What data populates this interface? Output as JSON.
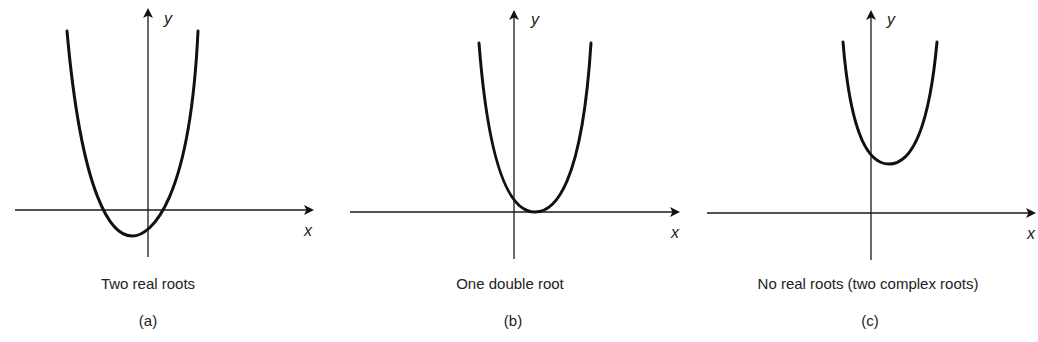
{
  "figure": {
    "panels": [
      {
        "id": "a",
        "caption": "Two real roots",
        "letter": "(a)",
        "x_label": "x",
        "y_label": "y",
        "case": "discriminant > 0",
        "curve": "upward parabola, vertex below x-axis, left of y-axis, crossing x-axis twice"
      },
      {
        "id": "b",
        "caption": "One double root",
        "letter": "(b)",
        "x_label": "x",
        "y_label": "y",
        "case": "discriminant = 0",
        "curve": "upward parabola, vertex touching x-axis, right of y-axis"
      },
      {
        "id": "c",
        "caption": "No real roots (two complex roots)",
        "letter": "(c)",
        "x_label": "x",
        "y_label": "y",
        "case": "discriminant < 0",
        "curve": "upward parabola, vertex above x-axis, right of y-axis, never crossing x-axis"
      }
    ],
    "colors": {
      "background": "#ffffff",
      "ink": "#111111"
    }
  }
}
